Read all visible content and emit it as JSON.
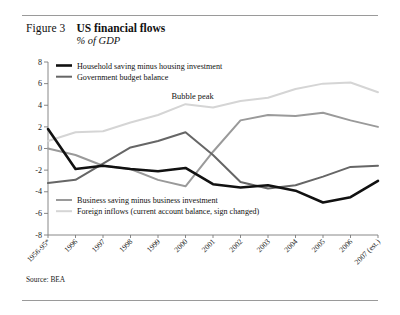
{
  "figure": {
    "label": "Figure 3",
    "title": "US financial flows",
    "subtitle": "% of GDP",
    "source": "Source: BEA"
  },
  "colors": {
    "household": "#111111",
    "government": "#666666",
    "business": "#9a9a9a",
    "foreign": "#d5d5d5",
    "axis": "#7a7a7a",
    "rule": "#9a9a9a"
  },
  "annotations": [
    {
      "text": "Bubble peak",
      "x_category": "2000",
      "y_value": 4.6
    }
  ],
  "legend_top": [
    {
      "label": "Household saving minus housing investment",
      "color": "#111111",
      "width": 2.6
    },
    {
      "label": "Government budget balance",
      "color": "#666666",
      "width": 2.0
    }
  ],
  "legend_bottom": [
    {
      "label": "Business saving minus business investment",
      "color": "#9a9a9a",
      "width": 2.0
    },
    {
      "label": "Foreign inflows (current account balance, sign changed)",
      "color": "#d5d5d5",
      "width": 2.0
    }
  ],
  "chart_data": {
    "type": "line",
    "title": "US financial flows",
    "subtitle": "% of GDP",
    "xlabel": "",
    "ylabel": "% of GDP",
    "ylim": [
      -8,
      8
    ],
    "yticks": [
      8,
      6,
      4,
      2,
      0,
      -2,
      -4,
      -6,
      -8
    ],
    "ytick_labels": [
      "8",
      "6",
      "4",
      "2",
      "0",
      "-2",
      "-4",
      "-6",
      "-8"
    ],
    "grid": false,
    "legend_position": "inside-top-left-and-bottom-left",
    "categories": [
      "1956-95*",
      "1996",
      "1997",
      "1998",
      "1999",
      "2000",
      "2001",
      "2002",
      "2003",
      "2004",
      "2005",
      "2006",
      "2007 (est.)"
    ],
    "series": [
      {
        "name": "Household saving minus housing investment",
        "color": "#111111",
        "values": [
          1.8,
          -1.9,
          -1.6,
          -1.9,
          -2.1,
          -1.8,
          -3.3,
          -3.6,
          -3.4,
          -3.9,
          -5.0,
          -4.5,
          -3.0
        ]
      },
      {
        "name": "Government budget balance",
        "color": "#666666",
        "values": [
          -3.2,
          -2.9,
          -1.4,
          0.1,
          0.7,
          1.5,
          -0.6,
          -3.1,
          -3.7,
          -3.4,
          -2.6,
          -1.7,
          -1.6
        ]
      },
      {
        "name": "Business saving minus business investment",
        "color": "#9a9a9a",
        "values": [
          0.0,
          -0.6,
          -1.6,
          -1.9,
          -2.9,
          -3.5,
          -0.3,
          2.6,
          3.1,
          3.0,
          3.3,
          2.6,
          2.0
        ]
      },
      {
        "name": "Foreign inflows (current account balance, sign changed)",
        "color": "#d5d5d5",
        "values": [
          0.7,
          1.5,
          1.6,
          2.4,
          3.1,
          4.1,
          3.8,
          4.4,
          4.7,
          5.5,
          6.0,
          6.1,
          5.2
        ]
      }
    ]
  }
}
